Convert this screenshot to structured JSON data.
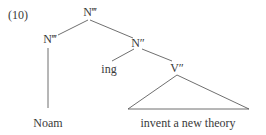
{
  "example": {
    "number": "(10)"
  },
  "tree": {
    "root": "N‴",
    "left_node": "N‴",
    "right_node": "N″",
    "affix": "ing",
    "verb_phrase": "V″",
    "left_leaf": "Noam",
    "triangle_leaf": "invent a new theory"
  }
}
